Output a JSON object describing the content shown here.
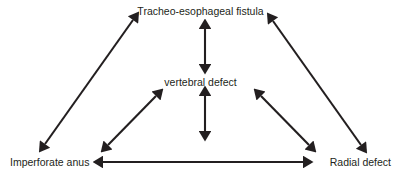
{
  "diagram": {
    "title_text": "",
    "background_color": "#ffffff",
    "stroke_color": "#231f20",
    "nodes": [
      {
        "id": "tef",
        "label": "Tracheo-esophageal fistula",
        "position": "top-center"
      },
      {
        "id": "vertebral",
        "label": "vertebral defect",
        "position": "middle-center"
      },
      {
        "id": "anus",
        "label": "Imperforate anus",
        "position": "bottom-left"
      },
      {
        "id": "radial",
        "label": "Radial defect",
        "position": "bottom-right"
      }
    ],
    "connections": [
      {
        "id": "tef-vertebral",
        "from": "tef",
        "to": "vertebral",
        "style": "double-arrow",
        "orientation": "vertical"
      },
      {
        "id": "vertebral-bottom",
        "from": "vertebral",
        "to": "bottom",
        "style": "double-arrow",
        "orientation": "vertical"
      },
      {
        "id": "anus-tef",
        "from": "anus",
        "to": "tef",
        "style": "double-arrow",
        "orientation": "diagonal-up-right"
      },
      {
        "id": "radial-tef",
        "from": "radial",
        "to": "tef",
        "style": "double-arrow",
        "orientation": "diagonal-up-left"
      },
      {
        "id": "anus-vertebral",
        "from": "anus",
        "to": "vertebral",
        "style": "double-arrow",
        "orientation": "diagonal-up-right"
      },
      {
        "id": "radial-vertebral",
        "from": "radial",
        "to": "vertebral",
        "style": "double-arrow",
        "orientation": "diagonal-up-left"
      },
      {
        "id": "anus-radial",
        "from": "anus",
        "to": "radial",
        "style": "double-arrow",
        "orientation": "horizontal"
      }
    ]
  }
}
